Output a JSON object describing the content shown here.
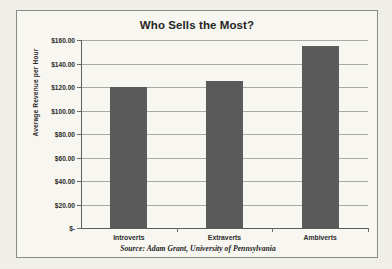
{
  "chart_data": {
    "type": "bar",
    "title": "Who Sells the Most?",
    "xlabel": "",
    "ylabel": "Average Revenue per Hour",
    "categories": [
      "Introverts",
      "Extraverts",
      "Ambiverts"
    ],
    "values": [
      120,
      125,
      155
    ],
    "ylim": [
      0,
      160
    ],
    "ytick_values": [
      0,
      20,
      40,
      60,
      80,
      100,
      120,
      140,
      160
    ],
    "ytick_labels": [
      "$-",
      "$20.00",
      "$40.00",
      "$60.00",
      "$80.00",
      "$100.00",
      "$120.00",
      "$140.00",
      "$160.00"
    ],
    "grid": true,
    "legend": false,
    "legend_position": "none",
    "bar_color": "#5a5a5a",
    "gridline_color": "#a8a8a4",
    "axis_color": "#5e5e5c",
    "source_note": "Source: Adam Grant, University of Pennsylvania"
  },
  "page": {
    "background_color": "#f1f0ea",
    "frame_background_color": "#f7f6f1",
    "frame_border_color": "#8a8a86"
  }
}
